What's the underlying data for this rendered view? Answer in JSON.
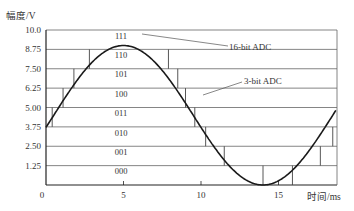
{
  "chart_data": {
    "type": "line",
    "title": "",
    "xlabel": "时间/ms",
    "ylabel": "幅度/V",
    "xlim": [
      0,
      18.7
    ],
    "ylim": [
      0,
      10.0
    ],
    "x_ticks": [
      0,
      5,
      10,
      15
    ],
    "x_tick_labels": [
      "0",
      "5",
      "10",
      "15"
    ],
    "y_ticks": [
      0,
      1.25,
      2.5,
      3.75,
      5.0,
      6.25,
      7.5,
      8.75,
      10.0
    ],
    "y_tick_labels": [
      "",
      "1.25",
      "2.50",
      "3.75",
      "5.00",
      "6.25",
      "7.50",
      "8.75",
      "10.0"
    ],
    "grid": "horizontal lines at each 1.25 V quantization level",
    "band_codes": [
      "000",
      "001",
      "010",
      "011",
      "100",
      "101",
      "110",
      "111"
    ],
    "series": [
      {
        "name": "16-bit ADC",
        "kind": "smooth sine",
        "amplitude": 4.5,
        "offset": 4.5,
        "period_ms": 18,
        "peak_ms": 5,
        "x": [
          0,
          1,
          2,
          3,
          4,
          5,
          6,
          7,
          8,
          9,
          10,
          11,
          12,
          13,
          14,
          15,
          16,
          17,
          18,
          18.7
        ],
        "values": [
          4.4,
          5.9,
          7.3,
          8.4,
          8.9,
          9.0,
          8.7,
          8.0,
          6.9,
          5.5,
          4.0,
          2.6,
          1.4,
          0.4,
          0.0,
          0.3,
          1.1,
          2.4,
          3.9,
          5.7
        ]
      },
      {
        "name": "3-bit ADC",
        "kind": "step",
        "steps": [
          {
            "x0": 0.0,
            "x1": 0.4,
            "level": 3.75
          },
          {
            "x0": 0.4,
            "x1": 1.1,
            "level": 5.0
          },
          {
            "x0": 1.1,
            "x1": 1.8,
            "level": 6.25
          },
          {
            "x0": 1.8,
            "x1": 2.8,
            "level": 7.5
          },
          {
            "x0": 2.8,
            "x1": 7.9,
            "level": 8.75
          },
          {
            "x0": 7.9,
            "x1": 8.5,
            "level": 7.5
          },
          {
            "x0": 8.5,
            "x1": 9.0,
            "level": 6.25
          },
          {
            "x0": 9.0,
            "x1": 9.6,
            "level": 5.0
          },
          {
            "x0": 9.6,
            "x1": 10.3,
            "level": 3.75
          },
          {
            "x0": 10.3,
            "x1": 11.5,
            "level": 2.5
          },
          {
            "x0": 11.5,
            "x1": 14.0,
            "level": 1.25
          },
          {
            "x0": 14.0,
            "x1": 15.9,
            "level": 0.0
          },
          {
            "x0": 15.9,
            "x1": 17.7,
            "level": 1.25
          },
          {
            "x0": 17.7,
            "x1": 18.5,
            "level": 2.5
          },
          {
            "x0": 18.5,
            "x1": 18.7,
            "level": 3.75
          }
        ]
      }
    ],
    "annotations": [
      {
        "text": "16-bit ADC",
        "points_to": "smooth sine near x≈8 ms, y≈8.75"
      },
      {
        "text": "3-bit ADC",
        "points_to": "step line near x≈9.5 ms, y≈4.2"
      }
    ],
    "legend": "none (inline annotations)"
  },
  "labels": {
    "ylabel": "幅度/V",
    "xlabel": "时间/ms",
    "annot_16bit": "16-bit ADC",
    "annot_3bit": "3-bit ADC"
  },
  "colors": {
    "curve": "#1a1a1a",
    "grid": "#555555",
    "axis": "#222222",
    "background": "#ffffff"
  }
}
